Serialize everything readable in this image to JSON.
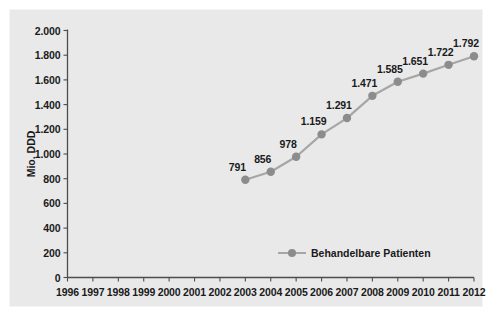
{
  "chart_data": {
    "type": "line",
    "title": "",
    "subtitle": "",
    "xlabel": "",
    "ylabel": "Mio. DDD",
    "categories": [
      "1996",
      "1997",
      "1998",
      "1999",
      "2000",
      "2001",
      "2002",
      "2003",
      "2004",
      "2005",
      "2006",
      "2007",
      "2008",
      "2009",
      "2010",
      "2011",
      "2012"
    ],
    "x": [
      1996,
      1997,
      1998,
      1999,
      2000,
      2001,
      2002,
      2003,
      2004,
      2005,
      2006,
      2007,
      2008,
      2009,
      2010,
      2011,
      2012
    ],
    "xlim": [
      1996,
      2012
    ],
    "ylim": [
      0,
      2000
    ],
    "yticks": [
      0,
      200,
      400,
      600,
      800,
      1000,
      1200,
      1400,
      1600,
      1800,
      2000
    ],
    "ytick_labels": [
      "0",
      "200",
      "400",
      "600",
      "800",
      "1.000",
      "1.200",
      "1.400",
      "1.600",
      "1.800",
      "2.000"
    ],
    "grid": false,
    "legend_position": "bottom-center",
    "series": [
      {
        "name": "Behandelbare Patienten",
        "color": "#a6a6a6",
        "marker_color": "#8c8c8c",
        "x": [
          2003,
          2004,
          2005,
          2006,
          2007,
          2008,
          2009,
          2010,
          2011,
          2012
        ],
        "values": [
          791,
          856,
          978,
          1159,
          1291,
          1471,
          1585,
          1651,
          1722,
          1792
        ],
        "data_labels": [
          "791",
          "856",
          "978",
          "1.159",
          "1.291",
          "1.471",
          "1.585",
          "1.651",
          "1.722",
          "1.792"
        ]
      }
    ]
  },
  "legend": {
    "entries": [
      {
        "label": "Behandelbare Patienten"
      }
    ]
  },
  "colors": {
    "plot_background": "#e9e9e9",
    "figure_background": "#ffffff",
    "axis": "#4d4d4d",
    "text": "#1a1a1a",
    "series_line": "#a6a6a6",
    "series_marker": "#8c8c8c"
  }
}
